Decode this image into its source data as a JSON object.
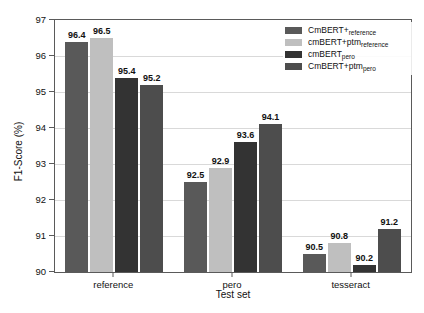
{
  "chart_data": {
    "type": "bar",
    "title": "",
    "xlabel": "Test set",
    "ylabel": "F1-Score (%)",
    "ylim": [
      90,
      97
    ],
    "yticks": [
      90,
      91,
      92,
      93,
      94,
      95,
      96,
      97
    ],
    "grid": true,
    "legend_position": "top-right",
    "categories": [
      "reference",
      "pero",
      "tesseract"
    ],
    "series": [
      {
        "name": "CmBERT+",
        "name_sub": "reference",
        "color": "#595959",
        "values": [
          96.4,
          92.5,
          90.5
        ]
      },
      {
        "name": "cmBERT+ptm",
        "name_sub": "reference",
        "color": "#bfbfbf",
        "values": [
          96.5,
          92.9,
          90.8
        ]
      },
      {
        "name": "cmBERT",
        "name_sub": "pero",
        "color": "#333333",
        "values": [
          95.4,
          93.6,
          90.2
        ]
      },
      {
        "name": "CmBERT+ptm",
        "name_sub": "pero",
        "color": "#4d4d4d",
        "values": [
          95.2,
          94.1,
          91.2
        ]
      }
    ]
  },
  "axis": {
    "ytick_labels": [
      "90",
      "91",
      "92",
      "93",
      "94",
      "95",
      "96",
      "97"
    ],
    "xtick_labels": [
      "reference",
      "pero",
      "tesseract"
    ],
    "ylabel_text": "F1-Score (%)",
    "xlabel_text": "Test set"
  },
  "colors": {
    "axis": "#5a5a5a",
    "grid": "#d9d9d9",
    "text": "#111111",
    "background": "#ffffff"
  }
}
